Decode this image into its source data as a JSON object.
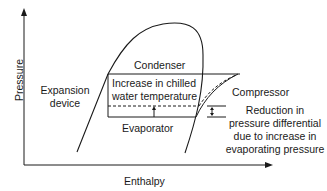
{
  "diagram": {
    "type": "pressure-enthalpy chart (refrigeration cycle)",
    "axes": {
      "y_label": "Pressure",
      "x_label": "Enthalpy"
    },
    "labels": {
      "condenser": "Condenser",
      "evaporator": "Evaporator",
      "compressor": "Compressor",
      "expansion_line1": "Expansion",
      "expansion_line2": "device",
      "chilled_line1": "Increase in chilled",
      "chilled_line2": "water temperature",
      "reduction_line1": "Reduction in",
      "reduction_line2": "pressure differential",
      "reduction_line3": "due to increase in",
      "reduction_line4": "evaporating pressure"
    },
    "colors": {
      "line": "#1a1a1a",
      "background": "#ffffff"
    }
  }
}
